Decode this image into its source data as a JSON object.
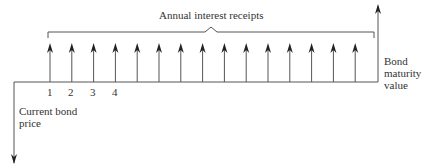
{
  "diagram": {
    "title_label": "Annual interest receipts",
    "left_label": [
      "Current bond",
      "price"
    ],
    "right_label": [
      "Bond",
      "maturity",
      "value"
    ],
    "period_numbers": [
      "1",
      "2",
      "3",
      "4"
    ],
    "interest_arrow_count": 15,
    "line_color": "#555555"
  }
}
